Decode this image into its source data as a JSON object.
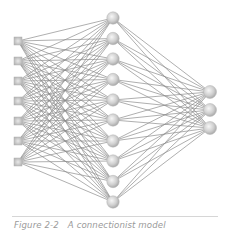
{
  "figure": {
    "label": "Figure 2-2",
    "title": "A connectionist model"
  },
  "network": {
    "layers": [
      {
        "name": "input",
        "shape": "square",
        "count": 7,
        "x": 18,
        "y": [
          41,
          61,
          81,
          101,
          121,
          141,
          162
        ],
        "size": 8
      },
      {
        "name": "hidden",
        "shape": "circle",
        "count": 10,
        "x": 113,
        "y": [
          18,
          38.5,
          59,
          79.5,
          100,
          120,
          141,
          161,
          181.5,
          202
        ],
        "radius": 6.2
      },
      {
        "name": "output",
        "shape": "circle",
        "count": 3,
        "x": 210,
        "y": [
          92,
          110,
          128
        ],
        "radius": 6.5
      }
    ],
    "connections": "fully-connected between adjacent layers",
    "colors": {
      "edge": "#8c8c8c",
      "node_light": "#f2f2f2",
      "node_dark": "#a8a8a8",
      "node_stroke": "#b5b5b5"
    }
  }
}
